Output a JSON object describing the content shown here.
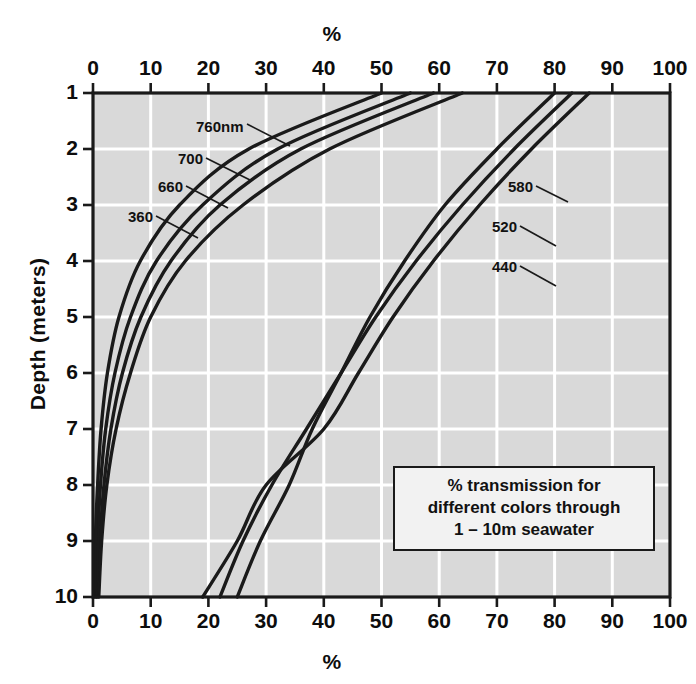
{
  "figure": {
    "top_axis_title": "%",
    "bottom_axis_title": "%",
    "y_axis_title": "Depth (meters)",
    "background_color": "#d9d9d9",
    "grid_color": "#ffffff",
    "curve_color": "#1a1a1a",
    "axis_color": "#1a1a1a"
  },
  "legend": {
    "line1": "% transmission for",
    "line2": "different colors through",
    "line3": "1 – 10m seawater"
  },
  "chart_data": {
    "type": "line",
    "title": "% transmission for different colors through 1 – 10m seawater",
    "xlabel": "%",
    "ylabel": "Depth (meters)",
    "xlim": [
      0,
      100
    ],
    "ylim": [
      1,
      10
    ],
    "y_inverted": true,
    "grid": true,
    "legend_position": "inside-bottom-right",
    "x_ticks": [
      0,
      10,
      20,
      30,
      40,
      50,
      60,
      70,
      80,
      90,
      100
    ],
    "y_ticks": [
      1,
      2,
      3,
      4,
      5,
      6,
      7,
      8,
      9,
      10
    ],
    "x_axis_duplicated_top_and_bottom": true,
    "series": [
      {
        "name": "760nm",
        "label": "760nm",
        "group": "left",
        "depth": [
          1,
          2,
          3,
          4,
          5,
          6,
          7,
          8,
          9,
          10
        ],
        "transmission": [
          64,
          41,
          26,
          16,
          10,
          6.5,
          4.0,
          2.4,
          1.5,
          1.0
        ]
      },
      {
        "name": "700",
        "label": "700",
        "group": "left",
        "depth": [
          1,
          2,
          3,
          4,
          5,
          6,
          7,
          8,
          9,
          10
        ],
        "transmission": [
          59,
          36,
          22,
          13.5,
          8.3,
          5.1,
          3.1,
          1.9,
          1.2,
          0.7
        ]
      },
      {
        "name": "660",
        "label": "660",
        "group": "left",
        "depth": [
          1,
          2,
          3,
          4,
          5,
          6,
          7,
          8,
          9,
          10
        ],
        "transmission": [
          55,
          32,
          19,
          11.0,
          6.5,
          3.8,
          2.2,
          1.3,
          0.8,
          0.5
        ]
      },
      {
        "name": "360",
        "label": "360",
        "group": "left",
        "depth": [
          1,
          2,
          3,
          4,
          5,
          6,
          7,
          8,
          9,
          10
        ],
        "transmission": [
          50,
          27,
          15,
          8.2,
          4.5,
          2.5,
          1.4,
          0.8,
          0.4,
          0.2
        ]
      },
      {
        "name": "580",
        "label": "580",
        "group": "right",
        "depth": [
          1,
          2,
          3,
          4,
          5,
          6,
          7,
          8,
          9,
          10
        ],
        "transmission": [
          86,
          76,
          67,
          59,
          52,
          46,
          40,
          30,
          25,
          19
        ]
      },
      {
        "name": "520",
        "label": "520",
        "group": "right",
        "depth": [
          1,
          2,
          3,
          4,
          5,
          6,
          7,
          8,
          9,
          10
        ],
        "transmission": [
          83,
          73,
          64,
          56,
          49,
          43,
          37,
          31,
          26,
          22
        ]
      },
      {
        "name": "440",
        "label": "440",
        "group": "right",
        "depth": [
          1,
          2,
          3,
          4,
          5,
          6,
          7,
          8,
          9,
          10
        ],
        "transmission": [
          80,
          70,
          61,
          54,
          48,
          43,
          38,
          34,
          29,
          25
        ]
      }
    ],
    "annotations": [
      {
        "text": "760nm",
        "x_px": 196,
        "y_px": 118
      },
      {
        "text": "700",
        "x_px": 178,
        "y_px": 150
      },
      {
        "text": "660",
        "x_px": 158,
        "y_px": 178
      },
      {
        "text": "360",
        "x_px": 128,
        "y_px": 208
      },
      {
        "text": "580",
        "x_px": 508,
        "y_px": 178
      },
      {
        "text": "520",
        "x_px": 492,
        "y_px": 218
      },
      {
        "text": "440",
        "x_px": 492,
        "y_px": 258
      }
    ]
  },
  "x_tick_labels": [
    "0",
    "10",
    "20",
    "30",
    "40",
    "50",
    "60",
    "70",
    "80",
    "90",
    "100"
  ],
  "y_tick_labels": [
    "1",
    "2",
    "3",
    "4",
    "5",
    "6",
    "7",
    "8",
    "9",
    "10"
  ]
}
